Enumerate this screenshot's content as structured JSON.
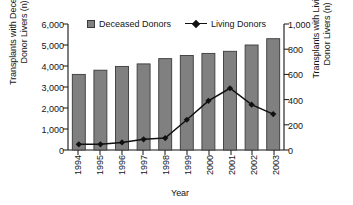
{
  "chart_data": {
    "type": "bar",
    "title": "",
    "xlabel": "Year",
    "categories": [
      "1994",
      "1995",
      "1996",
      "1997",
      "1998",
      "1999",
      "2000",
      "2001",
      "2002",
      "2003"
    ],
    "grid": false,
    "legend_position": "top-inside",
    "series": [
      {
        "name": "Deceased Donors",
        "type": "bar",
        "axis": "left",
        "color": "#808080",
        "edge_color": "#3a3a3a",
        "values": [
          3600,
          3800,
          3980,
          4100,
          4350,
          4500,
          4600,
          4700,
          5000,
          5300
        ]
      },
      {
        "name": "Living Donors",
        "type": "line",
        "axis": "right",
        "color": "#111111",
        "marker": "diamond",
        "values": [
          45,
          45,
          60,
          85,
          95,
          240,
          390,
          490,
          360,
          285
        ]
      }
    ],
    "axes": {
      "left": {
        "label": "Transplants with Deceased\nDonor Livers (n)",
        "ticks": [
          0,
          1000,
          2000,
          3000,
          4000,
          5000,
          6000
        ],
        "tick_labels": [
          "0",
          "1,000",
          "2,000",
          "3,000",
          "4,000",
          "5,000",
          "6,000"
        ],
        "lim": [
          0,
          6000
        ]
      },
      "right": {
        "label": "Transplants with Living\nDonor Livers (n)",
        "ticks": [
          0,
          200,
          400,
          600,
          800,
          1000
        ],
        "tick_labels": [
          "0",
          "200",
          "400",
          "600",
          "800",
          "1,000"
        ],
        "lim": [
          0,
          1000
        ]
      },
      "x": {
        "label": "Year"
      }
    }
  },
  "legend": {
    "bar_label": "Deceased Donors",
    "line_label": "Living Donors"
  }
}
